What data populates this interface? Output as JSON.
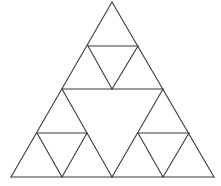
{
  "diagram": {
    "type": "sierpinski-triangle",
    "level": 2,
    "colors": {
      "background": "#ffffff",
      "stroke": "#3a3a3a"
    },
    "outer_triangle": {
      "apex": [
        112,
        2
      ],
      "bottom_left": [
        11,
        177
      ],
      "bottom_right": [
        214,
        177
      ]
    },
    "segments": [
      [
        112,
        2,
        11,
        177
      ],
      [
        112,
        2,
        214,
        177
      ],
      [
        11,
        177,
        214,
        177
      ],
      [
        62,
        89,
        163,
        89
      ],
      [
        62,
        89,
        112,
        177
      ],
      [
        163,
        89,
        112,
        177
      ],
      [
        88,
        46,
        138,
        46
      ],
      [
        88,
        46,
        112,
        89
      ],
      [
        138,
        46,
        112,
        89
      ],
      [
        37,
        133,
        87,
        133
      ],
      [
        37,
        133,
        62,
        177
      ],
      [
        87,
        133,
        62,
        177
      ],
      [
        138,
        133,
        189,
        133
      ],
      [
        138,
        133,
        163,
        177
      ],
      [
        189,
        133,
        163,
        177
      ]
    ]
  }
}
